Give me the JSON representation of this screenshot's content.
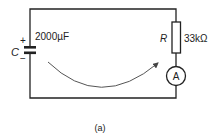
{
  "diagram": {
    "type": "circuit",
    "capacitor": {
      "symbol": "C",
      "value": "2000µF",
      "plus": "+",
      "minus": "−"
    },
    "resistor": {
      "symbol": "R",
      "value": "33kΩ"
    },
    "ammeter": {
      "symbol": "A"
    },
    "arrow": "curved-current-direction-arrow",
    "caption": "(a)"
  },
  "colors": {
    "wire": "#222222",
    "arrow": "#555555",
    "background": "#ffffff"
  }
}
